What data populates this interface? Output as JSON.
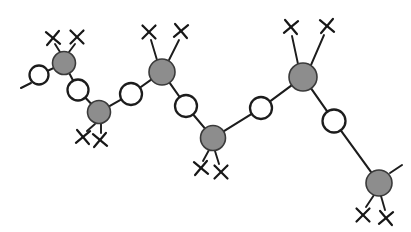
{
  "figure": {
    "background_color": "#ffffff",
    "width": 411,
    "height": 232
  },
  "style": {
    "filled_node_fill": "#8d8d8d",
    "filled_node_stroke": "#3a3a3a",
    "open_node_fill": "#ffffff",
    "open_node_stroke": "#1c1c1c",
    "bond_color": "#1c1c1c",
    "x_mark_color": "#171717",
    "bond_width": 2.1,
    "filled_node_radius": 12.5,
    "open_node_radius": 10.5,
    "x_mark_half_size": 6.5
  },
  "nodes": [
    {
      "id": "o1",
      "label": "open-circle-1",
      "type": "open",
      "x": 39,
      "y": 75,
      "r": 9.5
    },
    {
      "id": "f1",
      "label": "filled-node-1",
      "type": "filled",
      "x": 64,
      "y": 63,
      "r": 11.5
    },
    {
      "id": "o2",
      "label": "open-circle-2",
      "type": "open",
      "x": 78,
      "y": 90,
      "r": 10.5
    },
    {
      "id": "f2",
      "label": "filled-node-2",
      "type": "filled",
      "x": 99,
      "y": 112,
      "r": 11.5
    },
    {
      "id": "o3",
      "label": "open-circle-3",
      "type": "open",
      "x": 131,
      "y": 94,
      "r": 11.0
    },
    {
      "id": "f3",
      "label": "filled-node-3",
      "type": "filled",
      "x": 162,
      "y": 72,
      "r": 13.0
    },
    {
      "id": "o4",
      "label": "open-circle-4",
      "type": "open",
      "x": 186,
      "y": 106,
      "r": 11.0
    },
    {
      "id": "f4",
      "label": "filled-node-4",
      "type": "filled",
      "x": 213,
      "y": 138,
      "r": 12.5
    },
    {
      "id": "o5",
      "label": "open-circle-5",
      "type": "open",
      "x": 261,
      "y": 108,
      "r": 11.0
    },
    {
      "id": "f5",
      "label": "filled-node-5",
      "type": "filled",
      "x": 303,
      "y": 77,
      "r": 14.0
    },
    {
      "id": "o6",
      "label": "open-circle-6",
      "type": "open",
      "x": 334,
      "y": 121,
      "r": 11.5
    },
    {
      "id": "f6",
      "label": "filled-node-6",
      "type": "filled",
      "x": 379,
      "y": 183,
      "r": 13.0
    }
  ],
  "bonds": [
    {
      "label": "bond-o1-f1",
      "from": "o1",
      "to": "f1"
    },
    {
      "label": "bond-f1-o2",
      "from": "f1",
      "to": "o2"
    },
    {
      "label": "bond-o2-f2",
      "from": "o2",
      "to": "f2"
    },
    {
      "label": "bond-f2-o3",
      "from": "f2",
      "to": "o3"
    },
    {
      "label": "bond-o3-f3",
      "from": "o3",
      "to": "f3"
    },
    {
      "label": "bond-f3-o4",
      "from": "f3",
      "to": "o4"
    },
    {
      "label": "bond-o4-f4",
      "from": "o4",
      "to": "f4"
    },
    {
      "label": "bond-f4-o5",
      "from": "f4",
      "to": "o5"
    },
    {
      "label": "bond-o5-f5",
      "from": "o5",
      "to": "f5"
    },
    {
      "label": "bond-f5-o6",
      "from": "f5",
      "to": "o6"
    },
    {
      "label": "bond-o6-f6",
      "from": "o6",
      "to": "f6"
    }
  ],
  "terminal_stubs": [
    {
      "label": "stub-left-open-circle",
      "x1": 31,
      "y1": 83,
      "x2": 21,
      "y2": 88
    },
    {
      "label": "stub-right-filled-node",
      "x1": 390,
      "y1": 173,
      "x2": 402,
      "y2": 165
    }
  ],
  "substituents": [
    {
      "label": "X",
      "name": "x-sub-1",
      "on": "f1",
      "x": 53,
      "y": 38,
      "bond_x1": 60,
      "bond_y1": 52,
      "bond_x2": 55,
      "bond_y2": 44
    },
    {
      "label": "X",
      "name": "x-sub-2",
      "on": "f1",
      "x": 77,
      "y": 37,
      "bond_x1": 69,
      "bond_y1": 52,
      "bond_x2": 75,
      "bond_y2": 44
    },
    {
      "label": "X",
      "name": "x-sub-3",
      "on": "f2",
      "x": 83,
      "y": 137,
      "bond_x1": 95,
      "bond_y1": 124,
      "bond_x2": 87,
      "bond_y2": 131
    },
    {
      "label": "X",
      "name": "x-sub-4",
      "on": "f2",
      "x": 100,
      "y": 140,
      "bond_x1": 101,
      "bond_y1": 124,
      "bond_x2": 101,
      "bond_y2": 133
    },
    {
      "label": "X",
      "name": "x-sub-5",
      "on": "f3",
      "x": 149,
      "y": 32,
      "bond_x1": 157,
      "bond_y1": 60,
      "bond_x2": 151,
      "bond_y2": 40
    },
    {
      "label": "X",
      "name": "x-sub-6",
      "on": "f3",
      "x": 181,
      "y": 31,
      "bond_x1": 169,
      "bond_y1": 60,
      "bond_x2": 179,
      "bond_y2": 40
    },
    {
      "label": "X",
      "name": "x-sub-7",
      "on": "f4",
      "x": 201,
      "y": 168,
      "bond_x1": 209,
      "bond_y1": 150,
      "bond_x2": 203,
      "bond_y2": 161
    },
    {
      "label": "X",
      "name": "x-sub-8",
      "on": "f4",
      "x": 221,
      "y": 172,
      "bond_x1": 215,
      "bond_y1": 151,
      "bond_x2": 219,
      "bond_y2": 164
    },
    {
      "label": "X",
      "name": "x-sub-9",
      "on": "f5",
      "x": 291,
      "y": 27,
      "bond_x1": 298,
      "bond_y1": 64,
      "bond_x2": 292,
      "bond_y2": 36
    },
    {
      "label": "X",
      "name": "x-sub-10",
      "on": "f5",
      "x": 327,
      "y": 26,
      "bond_x1": 311,
      "bond_y1": 65,
      "bond_x2": 324,
      "bond_y2": 35
    },
    {
      "label": "X",
      "name": "x-sub-11",
      "on": "f6",
      "x": 363,
      "y": 215,
      "bond_x1": 374,
      "bond_y1": 195,
      "bond_x2": 366,
      "bond_y2": 207
    },
    {
      "label": "X",
      "name": "x-sub-12",
      "on": "f6",
      "x": 386,
      "y": 218,
      "bond_x1": 381,
      "bond_y1": 196,
      "bond_x2": 385,
      "bond_y2": 210
    }
  ]
}
